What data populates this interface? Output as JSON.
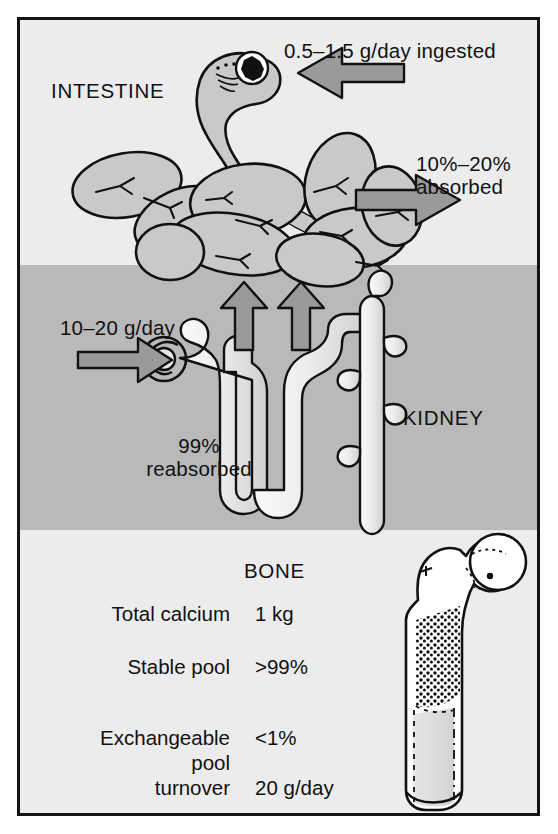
{
  "figure": {
    "title_absent": true,
    "colors": {
      "frame_border": "#141414",
      "band_light": "#ececed",
      "band_dark": "#b9b9b9",
      "arrow_fill": "#9a9a9a",
      "organ_fill_intestine": "#c9c9c9",
      "organ_fill_nephron": "#e2e2e2",
      "ink": "#111111"
    }
  },
  "intestine_section": {
    "organ_label": "INTESTINE",
    "ingested_label": "0.5–1.5 g/day ingested",
    "absorbed_label": "10%–20%\nabsorbed",
    "icons": {
      "inflow_arrow": "arrow-left-icon",
      "outflow_arrow": "arrow-right-icon",
      "stomach": "stomach-icon",
      "bowel_loops": "intestinal-loops-icon"
    }
  },
  "kidney_section": {
    "organ_label": "KIDNEY",
    "filtered_label": "10–20 g/day",
    "reabsorbed_label": "99%\nreabsorbed",
    "icons": {
      "inflow_arrow": "arrow-right-icon",
      "reabsorption_arrow_left": "arrow-up-icon",
      "reabsorption_arrow_right": "arrow-up-icon",
      "glomerulus": "glomerulus-icon",
      "nephron": "nephron-tubule-icon",
      "collecting_duct": "collecting-duct-icon"
    }
  },
  "bone_section": {
    "organ_label": "BONE",
    "icons": {
      "femur": "femur-bone-icon"
    },
    "rows": [
      {
        "key": "Total calcium",
        "value": "1 kg"
      },
      {
        "key": "Stable pool",
        "value": ">99%"
      },
      {
        "key": "Exchangeable",
        "value": "<1%"
      },
      {
        "key": "pool",
        "value": ""
      },
      {
        "key": "turnover",
        "value": "20 g/day"
      }
    ]
  }
}
